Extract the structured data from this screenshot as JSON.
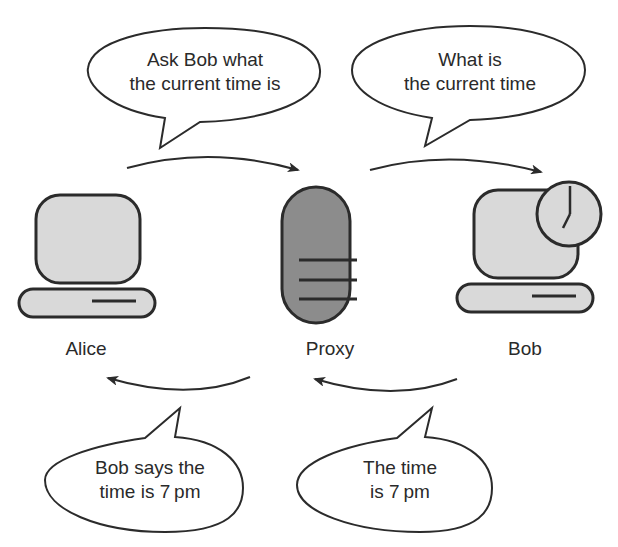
{
  "nodes": {
    "alice": {
      "label": "Alice",
      "fill": "#d9d9d9"
    },
    "proxy": {
      "label": "Proxy",
      "fill": "#8c8c8c"
    },
    "bob": {
      "label": "Bob",
      "fill": "#d9d9d9"
    }
  },
  "bubbles": {
    "alice_to_proxy": {
      "line1": "Ask Bob what",
      "line2": "the current time is"
    },
    "proxy_to_bob": {
      "line1": "What is",
      "line2": "the current time"
    },
    "proxy_to_alice": {
      "line1": "Bob says the",
      "line2": "time is 7 pm"
    },
    "bob_to_proxy": {
      "line1": "The time",
      "line2": "is 7 pm"
    }
  },
  "colors": {
    "stroke": "#2b2b2b",
    "screen": "#d9d9d9",
    "proxy": "#8c8c8c"
  }
}
